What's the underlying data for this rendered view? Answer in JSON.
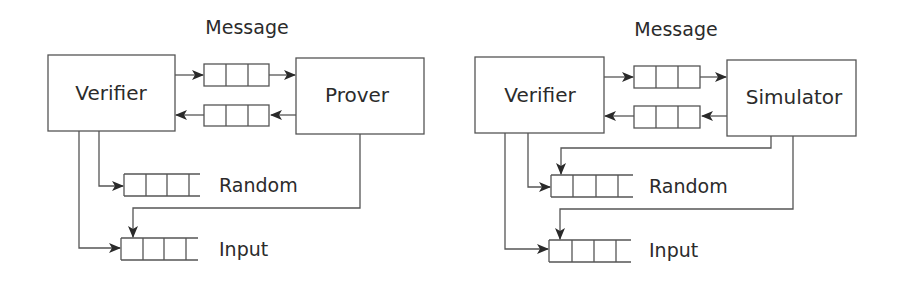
{
  "diagrams": [
    {
      "id": "real-interaction",
      "message_label": "Message",
      "left_party": "Verifier",
      "right_party": "Prover",
      "tapes": [
        {
          "label": "Random"
        },
        {
          "label": "Input"
        }
      ]
    },
    {
      "id": "simulated-interaction",
      "message_label": "Message",
      "left_party": "Verifier",
      "right_party": "Simulator",
      "tapes": [
        {
          "label": "Random"
        },
        {
          "label": "Input"
        }
      ]
    }
  ],
  "colors": {
    "stroke": "#555555",
    "arrow": "#2a2a2a",
    "text": "#2b2b2b",
    "background": "#ffffff"
  }
}
